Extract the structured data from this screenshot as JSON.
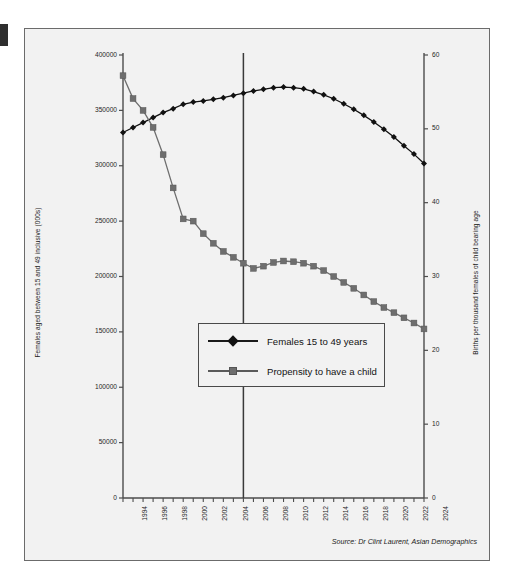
{
  "figure": {
    "source_note": "Source: Dr Clint Laurent, Asian Demographics"
  },
  "chart_data": {
    "type": "line",
    "title": "",
    "xlabel": "",
    "ylabel": "Females aged between 15 and 49 inclusive (000s)",
    "y2label": "Births per thousand females of child bearing age",
    "grid": false,
    "legend_position": "center-left-inside",
    "xlim": [
      1994,
      2024
    ],
    "ylim": [
      0,
      400000
    ],
    "y2lim": [
      0,
      60
    ],
    "ytick_labels": [
      "0",
      "50000",
      "100000",
      "150000",
      "200000",
      "250000",
      "300000",
      "350000",
      "400000"
    ],
    "yticks": [
      0,
      50000,
      100000,
      150000,
      200000,
      250000,
      300000,
      350000,
      400000
    ],
    "y2tick_labels": [
      "0",
      "10",
      "20",
      "30",
      "40",
      "50",
      "60"
    ],
    "y2ticks": [
      0,
      10,
      20,
      30,
      40,
      50,
      60
    ],
    "x": [
      1994,
      1995,
      1996,
      1997,
      1998,
      1999,
      2000,
      2001,
      2002,
      2003,
      2004,
      2005,
      2006,
      2007,
      2008,
      2009,
      2010,
      2011,
      2012,
      2013,
      2014,
      2015,
      2016,
      2017,
      2018,
      2019,
      2020,
      2021,
      2022,
      2023,
      2024
    ],
    "xtick_labels": [
      "1994",
      "1996",
      "1998",
      "2000",
      "2002",
      "2004",
      "2006",
      "2008",
      "2010",
      "2012",
      "2014",
      "2016",
      "2018",
      "2020",
      "2022",
      "2024"
    ],
    "annotations": [
      {
        "name": "reference-line",
        "type": "vline",
        "x": 2006,
        "color": "#3a3a3a"
      }
    ],
    "series": [
      {
        "name": "Females 15 to 49 years",
        "axis": "left",
        "marker": "diamond",
        "color": "#111111",
        "values": [
          330000,
          334500,
          339000,
          343500,
          348000,
          351500,
          355500,
          357500,
          358500,
          360000,
          361500,
          363500,
          365500,
          367500,
          369000,
          370500,
          371000,
          370500,
          369500,
          367000,
          364000,
          360500,
          356000,
          351000,
          345500,
          339500,
          333000,
          326000,
          318000,
          310500,
          302000
        ]
      },
      {
        "name": "Propensity to have a child",
        "axis": "right",
        "marker": "square",
        "color": "#6e6e6e",
        "values": [
          57.2,
          54.1,
          52.5,
          50.2,
          46.5,
          42.0,
          37.8,
          37.5,
          35.8,
          34.5,
          33.4,
          32.6,
          31.8,
          31.1,
          31.4,
          31.9,
          32.1,
          32.0,
          31.8,
          31.4,
          30.8,
          30.0,
          29.2,
          28.4,
          27.5,
          26.6,
          25.8,
          25.1,
          24.4,
          23.7,
          22.9
        ]
      }
    ]
  },
  "legend": {
    "items": [
      {
        "label": "Females 15 to 49 years",
        "marker": "diamond"
      },
      {
        "label": "Propensity to have a child",
        "marker": "square"
      }
    ]
  }
}
